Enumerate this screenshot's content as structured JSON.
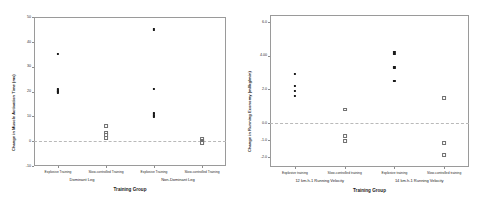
{
  "figure": {
    "panels": [
      {
        "id": "muscle-activation",
        "ytitle": "Change in Muscle Activation Time (ms)",
        "xtitle": "Training Group",
        "yticks": [
          "50",
          "40",
          "30",
          "20",
          "10",
          "0",
          "-10"
        ],
        "ytickvals": [
          50,
          40,
          30,
          20,
          10,
          0,
          -10
        ],
        "ylim": [
          -10,
          50
        ],
        "refline": 0,
        "categories": [
          "Explosive Training",
          "Slow-controlled Training",
          "Explosive Training",
          "Slow-controlled Training"
        ],
        "groups": [
          "Dominant Leg",
          "Non-Dominant Leg"
        ]
      },
      {
        "id": "running-economy",
        "ytitle": "Change in Running Economy (ml/kg/min)",
        "xtitle": "Training Group",
        "yticks": [
          "6.0",
          "4.00",
          "2.0",
          "0.0",
          "-1.0",
          "-2.0"
        ],
        "ytickvals": [
          6.0,
          4.0,
          2.0,
          0.0,
          -1.0,
          -2.0
        ],
        "ylim": [
          -2.6,
          6.4
        ],
        "refline": 0,
        "categories": [
          "Explosive training",
          "Slow-controlled training",
          "Explosive training",
          "Slow-controlled training"
        ],
        "groups": [
          "12 km.h-1 Running Velocity",
          "14 km.h-1 Running Velocity"
        ]
      }
    ]
  },
  "chart_data": [
    {
      "type": "scatter",
      "title": "",
      "xlabel": "Training Group",
      "ylabel": "Change in Muscle Activation Time (ms)",
      "ylim": [
        -10,
        50
      ],
      "yticks": [
        -10,
        0,
        10,
        20,
        30,
        40,
        50
      ],
      "grid": false,
      "legend": "none",
      "reference_line": 0,
      "categories": [
        "Explosive Training",
        "Slow-controlled Training",
        "Explosive Training",
        "Slow-controlled Training"
      ],
      "group_labels": [
        "Dominant Leg",
        "Non-Dominant Leg"
      ],
      "series": [
        {
          "name": "Dominant Leg - Explosive Training",
          "category_index": 0,
          "filled": true,
          "values": [
            35.0,
            21.2,
            20.8,
            20.4,
            20.0,
            19.6
          ]
        },
        {
          "name": "Dominant Leg - Slow-controlled Training",
          "category_index": 1,
          "filled": false,
          "values": [
            6.0,
            3.4,
            2.6,
            1.2
          ]
        },
        {
          "name": "Non-Dominant Leg - Explosive Training",
          "category_index": 2,
          "filled": true,
          "values": [
            45.0,
            21.0,
            11.4,
            10.8,
            10.2,
            9.8
          ]
        },
        {
          "name": "Non-Dominant Leg - Slow-controlled Training",
          "category_index": 3,
          "filled": false,
          "values": [
            1.0,
            0.2,
            -0.2,
            -0.6
          ]
        }
      ]
    },
    {
      "type": "scatter",
      "title": "",
      "xlabel": "Training Group",
      "ylabel": "Change in Running Economy (ml/kg/min)",
      "ylim": [
        -2.6,
        6.4
      ],
      "yticks": [
        -2.0,
        -1.0,
        0.0,
        2.0,
        4.0,
        6.0
      ],
      "grid": false,
      "legend": "none",
      "reference_line": 0,
      "categories": [
        "Explosive training",
        "Slow-controlled training",
        "Explosive training",
        "Slow-controlled training"
      ],
      "group_labels": [
        "12 km.h-1 Running Velocity",
        "14 km.h-1 Running Velocity"
      ],
      "series": [
        {
          "name": "12 km.h-1 - Explosive training",
          "category_index": 0,
          "filled": true,
          "values": [
            2.9,
            2.2,
            1.9,
            1.6
          ]
        },
        {
          "name": "12 km.h-1 - Slow-controlled training",
          "category_index": 1,
          "filled": false,
          "values": [
            0.8,
            -0.75,
            -1.05
          ]
        },
        {
          "name": "14 km.h-1 - Explosive training",
          "category_index": 2,
          "filled": true,
          "values": [
            4.2,
            4.1,
            3.3,
            2.5
          ]
        },
        {
          "name": "14 km.h-1 - Slow-controlled training",
          "category_index": 3,
          "filled": false,
          "values": [
            1.5,
            -1.2,
            -1.9
          ]
        }
      ]
    }
  ]
}
